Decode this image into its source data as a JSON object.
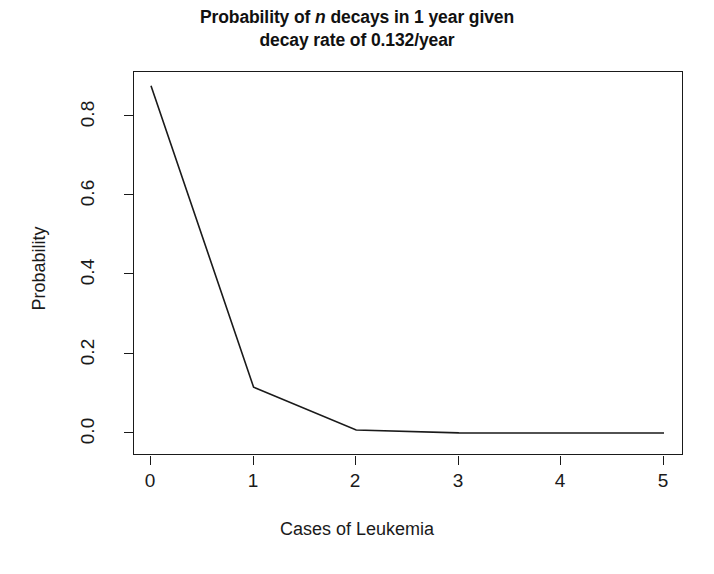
{
  "chart_data": {
    "type": "line",
    "title": "Probability of n decays in 1 year given decay rate of 0.132/year",
    "title_lines": [
      {
        "pre": "Probability of ",
        "italic": "n",
        "post": " decays in 1 year given"
      },
      {
        "pre": "decay rate of 0.132/year",
        "italic": "",
        "post": ""
      }
    ],
    "subtitle": "",
    "xlabel": "Cases of Leukemia",
    "ylabel": "Probability",
    "x": [
      0,
      1,
      2,
      3,
      4,
      5
    ],
    "values": [
      0.8764,
      0.1157,
      0.00764,
      0.000336,
      1.11e-05,
      2.9e-07
    ],
    "series": [
      {
        "name": "Poisson probability",
        "values": [
          0.8764,
          0.1157,
          0.00764,
          0.000336,
          1.11e-05,
          2.9e-07
        ]
      }
    ],
    "xlim": [
      0,
      5
    ],
    "ylim": [
      0,
      0.8764
    ],
    "xticks": [
      0,
      1,
      2,
      3,
      4,
      5
    ],
    "xtick_labels": [
      "0",
      "1",
      "2",
      "3",
      "4",
      "5"
    ],
    "yticks": [
      0.0,
      0.2,
      0.4,
      0.6,
      0.8
    ],
    "ytick_labels": [
      "0.0",
      "0.2",
      "0.4",
      "0.6",
      "0.8"
    ],
    "grid": false,
    "legend": false,
    "legend_position": "none",
    "line_color": "#1a1a1a",
    "axis_color": "#1a1a1a",
    "background_color": "#ffffff"
  }
}
